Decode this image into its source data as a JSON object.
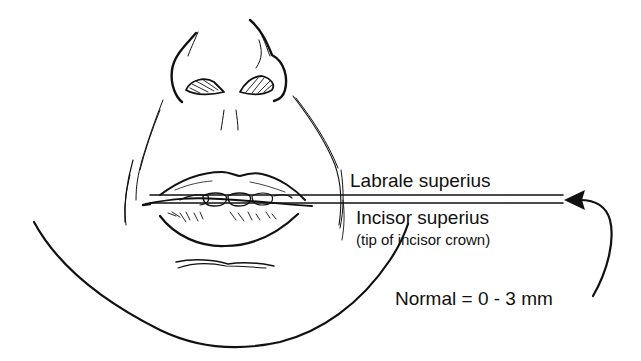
{
  "diagram": {
    "labels": {
      "labrale_superius": "Labrale superius",
      "incisor_superius": "Incisor superius",
      "incisor_note": "(tip of incisor crown)",
      "normal_range": "Normal = 0 - 3 mm"
    },
    "measurement": {
      "name": "Upper incisor exposure",
      "normal_min_mm": 0,
      "normal_max_mm": 3
    },
    "colors": {
      "line": "#111111",
      "background": "#ffffff"
    }
  }
}
